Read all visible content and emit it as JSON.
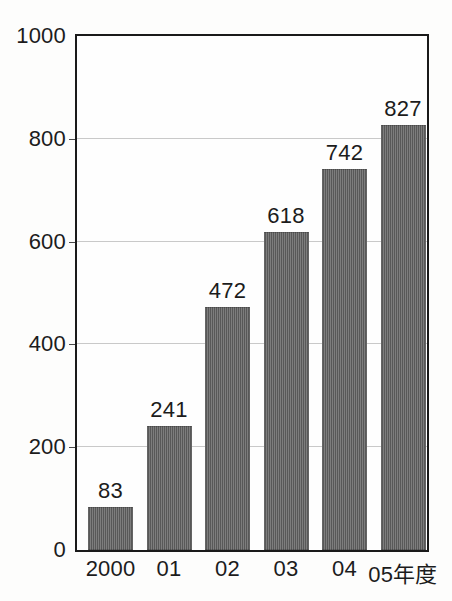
{
  "chart_data": {
    "type": "bar",
    "title": "",
    "subtitle": "",
    "xlabel": "",
    "ylabel": "",
    "categories": [
      "2000",
      "01",
      "02",
      "03",
      "04",
      "05年度"
    ],
    "values": [
      83,
      241,
      472,
      618,
      742,
      827
    ],
    "value_labels": [
      "83",
      "241",
      "472",
      "618",
      "742",
      "827"
    ],
    "ylim": [
      0,
      1000
    ],
    "y_ticks": [
      0,
      200,
      400,
      600,
      800,
      1000
    ],
    "y_tick_labels": [
      "0",
      "200",
      "400",
      "600",
      "800",
      "1000"
    ],
    "grid": true,
    "grid_axis": "y",
    "legend": false,
    "legend_position": "none",
    "series": [
      {
        "name": "",
        "values": [
          83,
          241,
          472,
          618,
          742,
          827
        ]
      }
    ],
    "colors": {
      "bar_fill": "#5d5d5d",
      "bar_edge": "#2a2a2a",
      "gridline": "#c9c9c9",
      "axis_frame": "#1a1a1a",
      "text": "#1c1c1c",
      "background": "#fdfdfc"
    }
  }
}
